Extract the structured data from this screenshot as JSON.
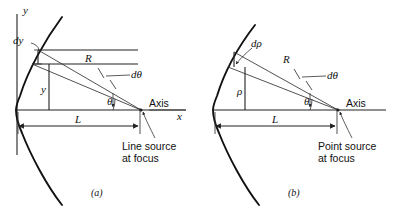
{
  "figure": {
    "background_color": "#ffffff",
    "ink_color": "#111111",
    "panels": [
      {
        "id": "a",
        "caption": "(a)",
        "source_label_line_1": "Line source",
        "source_label_line_2": "at focus",
        "axis_label": "Axis",
        "x_axis_label": "x",
        "y_axis_label": "y",
        "length_label": "L",
        "radius_label": "R",
        "angle_label": "θ",
        "angle_increment_label": "dθ",
        "aperture_label": "y",
        "aperture_increment_label": "dy"
      },
      {
        "id": "b",
        "caption": "(b)",
        "source_label_line_1": "Point source",
        "source_label_line_2": "at focus",
        "axis_label": "Axis",
        "x_axis_label": "",
        "y_axis_label": "",
        "length_label": "L",
        "radius_label": "R",
        "angle_label": "θ",
        "angle_increment_label": "dθ",
        "aperture_label": "ρ",
        "aperture_increment_label": "dρ"
      }
    ]
  }
}
